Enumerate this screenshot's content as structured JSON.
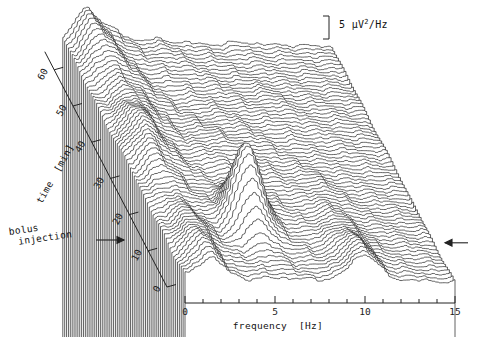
{
  "figure": {
    "type": "waterfall-spectral-array",
    "caption_absent": true
  },
  "axes": {
    "x": {
      "label": "frequency  [Hz]",
      "unit": "Hz",
      "ticks": [
        "0",
        "5",
        "10",
        "15"
      ],
      "tick_values": [
        0,
        5,
        10,
        15
      ],
      "minor_step": 1,
      "range": [
        0,
        15
      ]
    },
    "y": {
      "label": "time  [min]",
      "unit": "min",
      "ticks": [
        "0",
        "10",
        "20",
        "30",
        "40",
        "50",
        "60"
      ],
      "tick_values": [
        0,
        10,
        20,
        30,
        40,
        50,
        60
      ],
      "range": [
        0,
        65
      ]
    },
    "z": {
      "label": "5 μV",
      "label_sup": "2",
      "label_tail": "/Hz",
      "scalebar_value": 5,
      "scalebar_unit": "μV2/Hz"
    }
  },
  "annotations": {
    "bolus_line1": "bolus",
    "bolus_line2": "injection",
    "bolus_arrow": "→",
    "right_marker_arrow": "←",
    "right_marker_time": 10
  },
  "style": {
    "line_color": "#000000",
    "fill_color": "#ffffff",
    "axis_color": "#222222",
    "background": "#ffffff"
  },
  "chart_data": {
    "type": "line",
    "title": "",
    "xlabel": "frequency  [Hz]",
    "ylabel": "time  [min]",
    "zlabel": "5 μV2/Hz",
    "xlim": [
      0,
      15
    ],
    "ylim": [
      0,
      65
    ],
    "grid": false,
    "legend": "none",
    "trace_count": 66,
    "time_step_min": 1,
    "x_sample_count": 76,
    "x_step_hz": 0.2,
    "peaks": [
      {
        "name": "delta",
        "freq_hz": 1.4,
        "note": "persistent low-frequency peak at all times"
      },
      {
        "name": "theta",
        "freq_hz": 5.0,
        "note": "large transient peak maximal near t=14-18 min after bolus injection"
      },
      {
        "name": "alpha",
        "freq_hz": 10.0,
        "note": "peak prominent at early times t<20 min, decays later"
      },
      {
        "name": "beta",
        "freq_hz": 2.3,
        "note": "secondary shoulder visible at late times"
      }
    ],
    "series_description": "Each trace is one EEG power spectrum (uV^2/Hz) over 0-15 Hz at successive 1-min epochs; traces offset upward-left with hidden-line removal."
  }
}
